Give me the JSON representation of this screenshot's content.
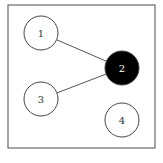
{
  "diagram": {
    "type": "graph",
    "frame": {
      "x": 8,
      "y": 5,
      "width": 147,
      "height": 143
    },
    "nodes": [
      {
        "id": "1",
        "label": "1",
        "cx": 41,
        "cy": 33,
        "r": 17,
        "fill": "#ffffff",
        "text_color": "#333333"
      },
      {
        "id": "2",
        "label": "2",
        "cx": 122,
        "cy": 68,
        "r": 17,
        "fill": "#000000",
        "text_color": "#ffffff"
      },
      {
        "id": "3",
        "label": "3",
        "cx": 41,
        "cy": 99,
        "r": 17,
        "fill": "#ffffff",
        "text_color": "#333333"
      },
      {
        "id": "4",
        "label": "4",
        "cx": 122,
        "cy": 120,
        "r": 17,
        "fill": "#ffffff",
        "text_color": "#333333"
      }
    ],
    "edges": [
      {
        "from": "1",
        "to": "2"
      },
      {
        "from": "3",
        "to": "2"
      }
    ]
  }
}
